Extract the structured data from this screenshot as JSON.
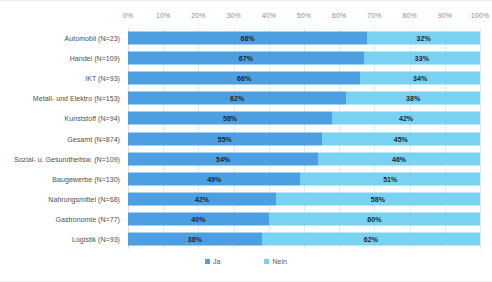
{
  "chart_data": {
    "type": "bar",
    "subtype": "100% stacked horizontal bar",
    "title": "",
    "xlabel": "",
    "ylabel": "",
    "xlim": [
      0,
      100
    ],
    "xticks": [
      "0%",
      "10%",
      "20%",
      "30%",
      "40%",
      "50%",
      "60%",
      "70%",
      "80%",
      "90%",
      "100%"
    ],
    "xtick_values": [
      0,
      10,
      20,
      30,
      40,
      50,
      60,
      70,
      80,
      90,
      100
    ],
    "grid": true,
    "grid_axis": "x",
    "legend_position": "bottom-center",
    "categories": [
      "Automobil (N=23)",
      "Handel (N=109)",
      "IKT (N=93)",
      "Metall- und Elektro (N=153)",
      "Kunststoff (N=94)",
      "Gesamt (N=874)",
      "Sozial- u. Gesundheitsw. (N=109)",
      "Baugewerbe (N=130)",
      "Nahrungsmittel (N=68)",
      "Gastronomie (N=77)",
      "Logistik (N=93)"
    ],
    "series": [
      {
        "name": "Ja",
        "color": "#4c9fe0",
        "values": [
          68,
          67,
          66,
          62,
          58,
          55,
          54,
          49,
          42,
          40,
          38
        ],
        "labels": [
          "68%",
          "67%",
          "66%",
          "62%",
          "58%",
          "55%",
          "54%",
          "49%",
          "42%",
          "40%",
          "38%"
        ]
      },
      {
        "name": "Nein",
        "color": "#79d2f2",
        "values": [
          32,
          33,
          34,
          38,
          42,
          45,
          46,
          51,
          58,
          60,
          62
        ],
        "labels": [
          "32%",
          "33%",
          "34%",
          "38%",
          "42%",
          "45%",
          "46%",
          "51%",
          "58%",
          "60%",
          "62%"
        ]
      }
    ]
  },
  "legend": {
    "items": [
      {
        "label": "Ja",
        "color": "#4c9fe0"
      },
      {
        "label": "Nein",
        "color": "#79d2f2"
      }
    ]
  },
  "colors": {
    "series_ja": "#4c9fe0",
    "series_nein": "#79d2f2",
    "gridline": "#e6eaed",
    "tick_text": "#8a8f94",
    "category_text": "#4c4f52",
    "value_text": "#21262b",
    "background": "#ffffff"
  }
}
